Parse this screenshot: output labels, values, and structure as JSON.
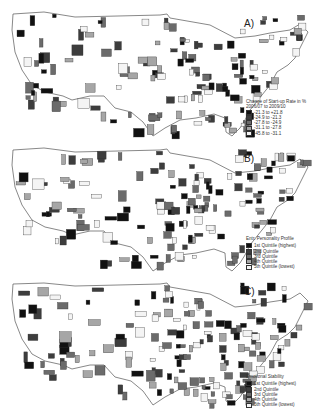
{
  "panels": [
    {
      "label": "A)",
      "legend": {
        "title": "Change of Start-up Rate in %",
        "subtitle": "2006/07 to 2009/10",
        "items": [
          {
            "label": "-21.3 to +21.8",
            "color": "#111111"
          },
          {
            "label": "-24.9 to -21.3",
            "color": "#3d3d3d"
          },
          {
            "label": "-27.8 to -24.9",
            "color": "#6b6b6b"
          },
          {
            "label": "-31.1 to -27.8",
            "color": "#a6a6a6"
          },
          {
            "label": "-45.8 to -31.1",
            "color": "#f4f4f4"
          }
        ]
      }
    },
    {
      "label": "B)",
      "legend": {
        "title": "Entr. Personality Profile",
        "subtitle": "",
        "items": [
          {
            "label": "1st Quintile (highest)",
            "color": "#111111"
          },
          {
            "label": "2nd Quintile",
            "color": "#3d3d3d"
          },
          {
            "label": "3rd Quintile",
            "color": "#6b6b6b"
          },
          {
            "label": "4th Quintile",
            "color": "#a6a6a6"
          },
          {
            "label": "5th Quintile (lowest)",
            "color": "#f4f4f4"
          }
        ]
      }
    },
    {
      "label": "C)",
      "legend": {
        "title": "Emotional Stability",
        "subtitle": "",
        "items": [
          {
            "label": "1st Quintile (highest)",
            "color": "#111111"
          },
          {
            "label": "2nd Quintile",
            "color": "#3d3d3d"
          },
          {
            "label": "3rd Quintile",
            "color": "#6b6b6b"
          },
          {
            "label": "4th Quintile",
            "color": "#a6a6a6"
          },
          {
            "label": "5th Quintile (lowest)",
            "color": "#f4f4f4"
          }
        ]
      }
    }
  ],
  "map": {
    "region": "Contiguous United States",
    "unit": "Metropolitan areas (grayscale choropleth)"
  }
}
